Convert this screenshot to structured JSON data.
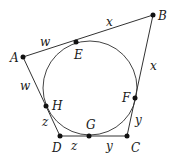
{
  "diagram": {
    "circle": {
      "cx": 90,
      "cy": 88,
      "r": 47
    },
    "vertices": {
      "A": {
        "label": "A",
        "x": 23,
        "y": 57
      },
      "B": {
        "label": "B",
        "x": 153,
        "y": 15
      },
      "C": {
        "label": "C",
        "x": 127,
        "y": 136
      },
      "D": {
        "label": "D",
        "x": 60,
        "y": 136
      }
    },
    "tangent_points": {
      "E": {
        "label": "E",
        "x": 76,
        "y": 42
      },
      "F": {
        "label": "F",
        "x": 135,
        "y": 98
      },
      "G": {
        "label": "G",
        "x": 89,
        "y": 136
      },
      "H": {
        "label": "H",
        "x": 46,
        "y": 106
      }
    },
    "segment_labels": {
      "AE": "w",
      "EB": "x",
      "BF": "x",
      "FC": "y",
      "CG": "y",
      "GD": "z",
      "DH": "z",
      "HA": "w"
    }
  }
}
